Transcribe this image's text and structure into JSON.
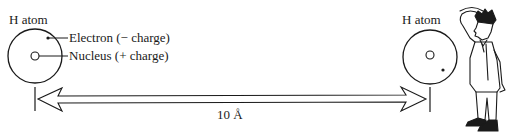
{
  "diagram": {
    "left_atom": {
      "title": "H atom",
      "electron_label": "Electron (− charge)",
      "nucleus_label": "Nucleus (+ charge)"
    },
    "right_atom": {
      "title": "H atom"
    },
    "distance_label": "10 Å",
    "figure": "observer-person-scratching-head",
    "colors": {
      "ink": "#1a1a1a",
      "background": "#ffffff"
    }
  }
}
